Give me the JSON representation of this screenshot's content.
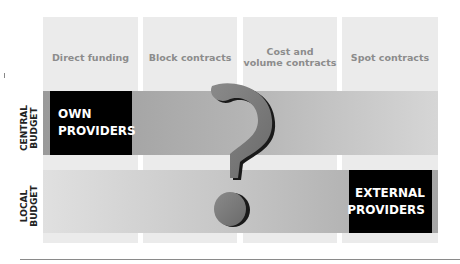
{
  "columns": [
    {
      "label": "Direct funding"
    },
    {
      "label": "Block contracts"
    },
    {
      "label": "Cost and\nvolume contracts"
    },
    {
      "label": "Spot contracts"
    }
  ],
  "rows": [
    {
      "label": "CENTRAL\nBUDGET",
      "box": "OWN\nPROVIDERS"
    },
    {
      "label": "LOCAL\nBUDGET",
      "box": "EXTERNAL\nPROVIDERS"
    }
  ],
  "center_symbol": "question-mark",
  "colors": {
    "column_bg": "#ebebeb",
    "box_bg": "#000000",
    "box_text": "#ffffff",
    "column_text": "#8c8c8c",
    "question_mark": "#7a7a7a"
  }
}
